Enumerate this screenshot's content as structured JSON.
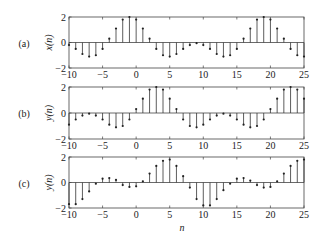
{
  "figure": {
    "xlabel": "n",
    "panels": [
      {
        "tag": "(a)",
        "ylabel": "x(n)"
      },
      {
        "tag": "(b)",
        "ylabel": "y(n)"
      },
      {
        "tag": "(c)",
        "ylabel": "y(n)"
      }
    ]
  },
  "chart_data": [
    {
      "type": "stem",
      "panel_label": "(a)",
      "ylabel": "x(n)",
      "xlabel": "",
      "xlim": [
        -10,
        25
      ],
      "ylim": [
        -2,
        2
      ],
      "xticks": [
        -10,
        -5,
        0,
        5,
        10,
        15,
        20,
        25
      ],
      "yticks": [
        -2,
        0,
        2
      ],
      "x": [
        -10,
        -9,
        -8,
        -7,
        -6,
        -5,
        -4,
        -3,
        -2,
        -1,
        0,
        1,
        2,
        3,
        4,
        5,
        6,
        7,
        8,
        9,
        10,
        11,
        12,
        13,
        14,
        15,
        16,
        17,
        18,
        19,
        20,
        21,
        22,
        23,
        24,
        25
      ],
      "values": [
        -0.2,
        -0.5,
        -0.9,
        -1.1,
        -1.0,
        -0.5,
        0.3,
        1.1,
        1.8,
        2.0,
        1.8,
        1.1,
        0.3,
        -0.5,
        -1.0,
        -1.1,
        -0.9,
        -0.5,
        -0.2,
        -0.05,
        -0.2,
        -0.5,
        -0.9,
        -1.1,
        -1.0,
        -0.5,
        0.3,
        1.1,
        1.8,
        2.0,
        1.8,
        1.1,
        0.3,
        -0.5,
        -1.0,
        -1.1
      ]
    },
    {
      "type": "stem",
      "panel_label": "(b)",
      "ylabel": "y(n)",
      "xlabel": "",
      "xlim": [
        -10,
        25
      ],
      "ylim": [
        -2,
        2
      ],
      "xticks": [
        -10,
        -5,
        0,
        5,
        10,
        15,
        20,
        25
      ],
      "yticks": [
        -2,
        0,
        2
      ],
      "x": [
        -10,
        -9,
        -8,
        -7,
        -6,
        -5,
        -4,
        -3,
        -2,
        -1,
        0,
        1,
        2,
        3,
        4,
        5,
        6,
        7,
        8,
        9,
        10,
        11,
        12,
        13,
        14,
        15,
        16,
        17,
        18,
        19,
        20,
        21,
        22,
        23,
        24,
        25
      ],
      "values": [
        -0.9,
        -0.5,
        -0.2,
        -0.05,
        -0.2,
        -0.5,
        -0.9,
        -1.1,
        -1.0,
        -0.5,
        0.3,
        1.1,
        1.8,
        2.0,
        1.8,
        1.1,
        0.3,
        -0.5,
        -1.0,
        -1.1,
        -0.9,
        -0.5,
        -0.2,
        -0.05,
        -0.2,
        -0.5,
        -0.9,
        -1.1,
        -1.0,
        -0.5,
        0.3,
        1.1,
        1.8,
        2.0,
        1.8,
        1.1
      ]
    },
    {
      "type": "stem",
      "panel_label": "(c)",
      "ylabel": "y(n)",
      "xlabel": "n",
      "xlim": [
        -10,
        25
      ],
      "ylim": [
        -2,
        2
      ],
      "xticks": [
        -10,
        -5,
        0,
        5,
        10,
        15,
        20,
        25
      ],
      "yticks": [
        -2,
        0,
        2
      ],
      "x": [
        -10,
        -9,
        -8,
        -7,
        -6,
        -5,
        -4,
        -3,
        -2,
        -1,
        0,
        1,
        2,
        3,
        4,
        5,
        6,
        7,
        8,
        9,
        10,
        11,
        12,
        13,
        14,
        15,
        16,
        17,
        18,
        19,
        20,
        21,
        22,
        23,
        24,
        25
      ],
      "values": [
        -1.7,
        -1.7,
        -1.3,
        -0.7,
        -0.1,
        0.3,
        0.35,
        0.2,
        -0.2,
        -0.35,
        -0.3,
        0.1,
        0.7,
        1.3,
        1.7,
        1.8,
        1.3,
        0.5,
        -0.4,
        -1.3,
        -1.8,
        -1.8,
        -1.3,
        -0.6,
        -0.1,
        0.3,
        0.35,
        0.15,
        -0.2,
        -0.4,
        -0.35,
        0.1,
        0.7,
        1.3,
        1.7,
        1.8
      ]
    }
  ]
}
